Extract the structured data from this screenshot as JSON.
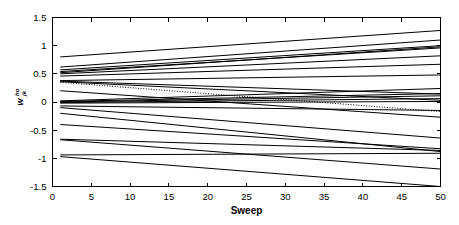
{
  "chart_data": {
    "type": "line",
    "title": "",
    "subtitle": "",
    "xlabel": "Sweep",
    "ylabel": "w_jk^ho",
    "ylabel_base": "w",
    "ylabel_subscript": "jk",
    "ylabel_superscript": "ho",
    "xlim": [
      0,
      50
    ],
    "ylim": [
      -1.5,
      1.5
    ],
    "xticks": [
      0,
      5,
      10,
      15,
      20,
      25,
      30,
      35,
      40,
      45,
      50
    ],
    "xticklabels": [
      "0",
      "5",
      "10",
      "15",
      "20",
      "25",
      "30",
      "35",
      "40",
      "45",
      "50"
    ],
    "yticks": [
      -1.5,
      -1,
      -0.5,
      0,
      0.5,
      1,
      1.5
    ],
    "yticklabels": [
      "-1.5",
      "-1",
      "-0.5",
      "0",
      "0.5",
      "1",
      "1.5"
    ],
    "grid": false,
    "legend": false,
    "legend_position": "none",
    "line_color": "#000000",
    "background_color": "#ffffff",
    "x": [
      1,
      50
    ],
    "series": [
      {
        "name": "w1",
        "values": [
          0.8,
          1.27
        ],
        "style": "solid"
      },
      {
        "name": "w2",
        "values": [
          0.62,
          1.1
        ],
        "style": "solid"
      },
      {
        "name": "w3",
        "values": [
          0.57,
          1.0
        ],
        "style": "solid"
      },
      {
        "name": "w4",
        "values": [
          0.54,
          0.96
        ],
        "style": "solid"
      },
      {
        "name": "w5",
        "values": [
          0.52,
          0.98
        ],
        "style": "solid"
      },
      {
        "name": "w6",
        "values": [
          0.5,
          0.82
        ],
        "style": "solid"
      },
      {
        "name": "w7",
        "values": [
          0.46,
          0.67
        ],
        "style": "solid"
      },
      {
        "name": "w8",
        "values": [
          0.38,
          0.48
        ],
        "style": "solid"
      },
      {
        "name": "w9",
        "values": [
          0.37,
          0.14
        ],
        "style": "solid"
      },
      {
        "name": "w10",
        "values": [
          0.36,
          0.03
        ],
        "style": "solid"
      },
      {
        "name": "w11",
        "values": [
          0.35,
          -0.17
        ],
        "style": "dotted"
      },
      {
        "name": "w12",
        "values": [
          0.2,
          -0.27
        ],
        "style": "solid"
      },
      {
        "name": "w13",
        "values": [
          0.02,
          0.24
        ],
        "style": "solid"
      },
      {
        "name": "w14",
        "values": [
          0.01,
          0.15
        ],
        "style": "solid"
      },
      {
        "name": "w15",
        "values": [
          0.0,
          0.11
        ],
        "style": "solid"
      },
      {
        "name": "w16",
        "values": [
          -0.01,
          0.06
        ],
        "style": "solid"
      },
      {
        "name": "w17",
        "values": [
          -0.02,
          0.01
        ],
        "style": "solid"
      },
      {
        "name": "w18",
        "values": [
          -0.07,
          -0.15
        ],
        "style": "solid"
      },
      {
        "name": "w19",
        "values": [
          -0.1,
          -0.64
        ],
        "style": "solid"
      },
      {
        "name": "w20",
        "values": [
          -0.2,
          -0.88
        ],
        "style": "solid"
      },
      {
        "name": "w21",
        "values": [
          -0.4,
          -0.83
        ],
        "style": "solid"
      },
      {
        "name": "w22",
        "values": [
          -0.66,
          -0.86
        ],
        "style": "solid"
      },
      {
        "name": "w23",
        "values": [
          -0.67,
          -1.19
        ],
        "style": "solid"
      },
      {
        "name": "w24",
        "values": [
          -0.94,
          -0.91
        ],
        "style": "solid"
      },
      {
        "name": "w25",
        "values": [
          -0.97,
          -1.5
        ],
        "style": "solid"
      }
    ]
  },
  "figure": {
    "axis_color": "#000000",
    "plot_background": "#ffffff"
  }
}
